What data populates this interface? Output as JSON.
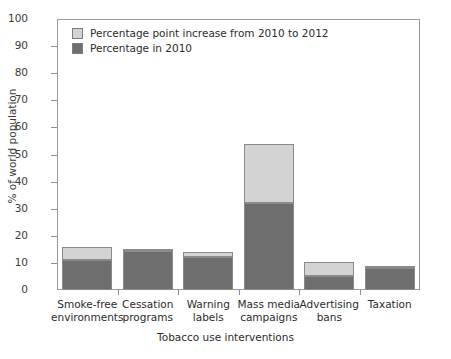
{
  "chart_data": {
    "type": "bar",
    "stacked": true,
    "title": "",
    "xlabel": "Tobacco use interventions",
    "ylabel": "% of world population",
    "ylim": [
      0,
      100
    ],
    "yticks": [
      0,
      10,
      20,
      30,
      40,
      50,
      60,
      70,
      80,
      90,
      100
    ],
    "grid": false,
    "legend_position": "top-left",
    "categories": [
      "Smoke-free environments",
      "Cessation programs",
      "Warning labels",
      "Mass media campaigns",
      "Advertising bans",
      "Taxation"
    ],
    "category_lines": [
      [
        "Smoke-free",
        "environments"
      ],
      [
        "Cessation",
        "programs"
      ],
      [
        "Warning",
        "labels"
      ],
      [
        "Mass media",
        "campaigns"
      ],
      [
        "Advertising",
        "bans"
      ],
      [
        "Taxation"
      ]
    ],
    "series": [
      {
        "name": "Percentage in 2010",
        "color": "#6e6e6e",
        "values": [
          11,
          14.5,
          12,
          32,
          5,
          8
        ]
      },
      {
        "name": "Percentage point increase from 2010 to 2012",
        "color": "#d3d3d3",
        "values": [
          5,
          0.5,
          2,
          22,
          5.5,
          0.5
        ]
      }
    ],
    "totals": [
      16,
      15,
      14,
      54,
      10.5,
      8.5
    ]
  },
  "legend": {
    "items": [
      {
        "label": "Percentage point increase from 2010 to 2012",
        "color": "#d3d3d3"
      },
      {
        "label": "Percentage in 2010",
        "color": "#6e6e6e"
      }
    ]
  },
  "colors": {
    "light": "#d3d3d3",
    "dark": "#6e6e6e",
    "axis": "#9a9a9a",
    "text": "#2b2b2b"
  }
}
